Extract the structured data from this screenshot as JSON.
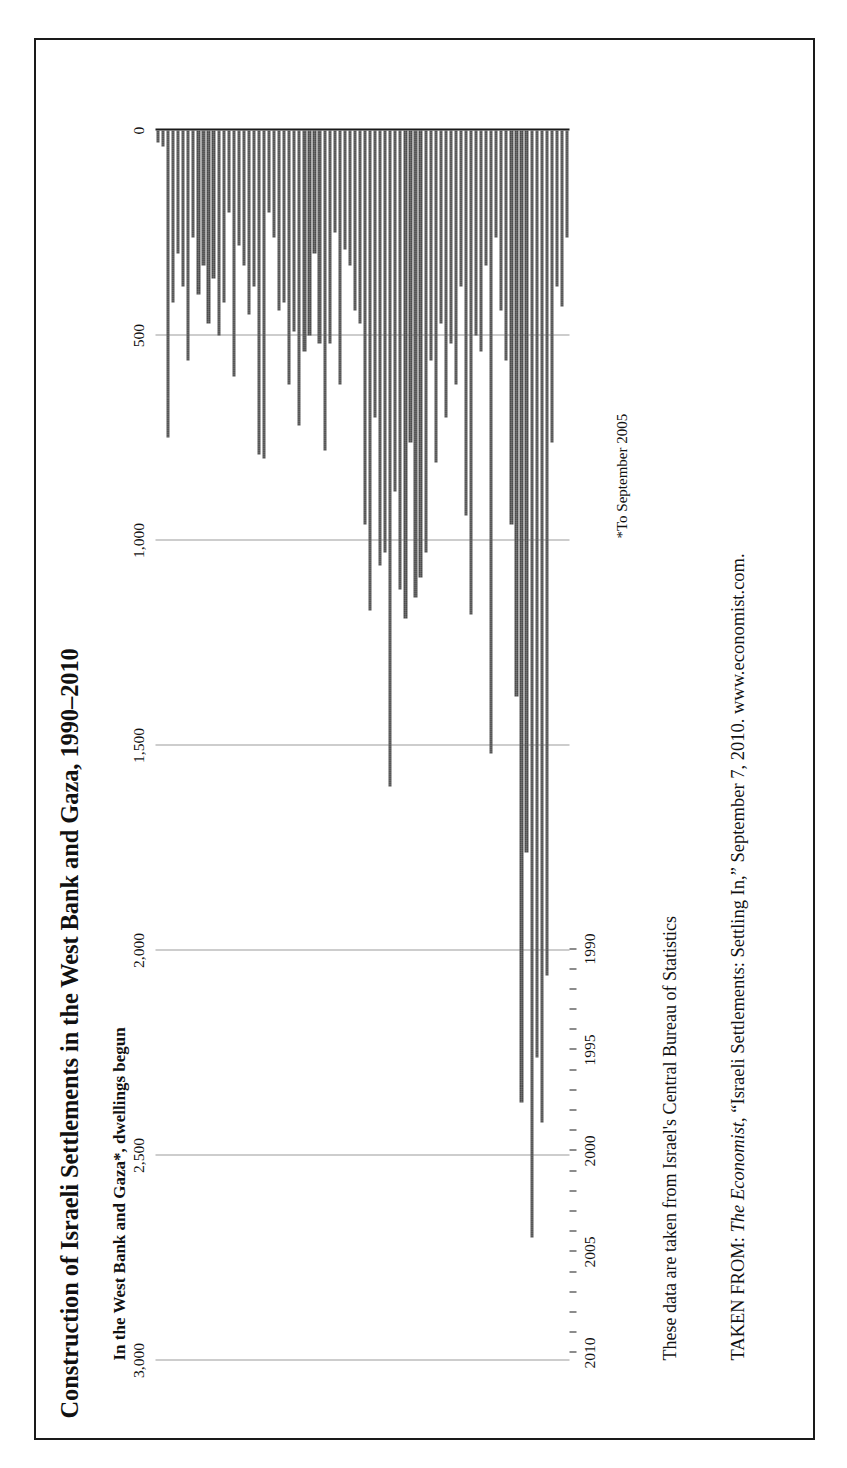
{
  "figure": {
    "title": "Construction of Israeli Settlements in the West Bank and Gaza, 1990–2010",
    "subtitle": "In the West Bank and Gaza*, dwellings begun",
    "footnote": "*To September 2005",
    "source_note": "These data are taken from Israel's Central Bureau of Statistics",
    "citation_prefix": "TAKEN FROM: ",
    "citation_publication": "The Economist",
    "citation_rest": ", “Israeli Settlements: Settling In,” September 7, 2010. www.economist.com.",
    "orientation": "rotated-90-ccw",
    "bar_color": "#4a4a4a",
    "grid_color": "#9b9b9b",
    "axis_color": "#1a1a1a",
    "border_color": "#1a1a1a"
  },
  "chart_data": {
    "type": "bar",
    "title": "Construction of Israeli Settlements in the West Bank and Gaza, 1990–2010",
    "subtitle": "In the West Bank and Gaza*, dwellings begun",
    "xlabel": "",
    "ylabel": "dwellings begun",
    "ylim": [
      0,
      3000
    ],
    "yticks": [
      0,
      500,
      1000,
      1500,
      2000,
      2500,
      3000
    ],
    "ytick_labels": [
      "0",
      "500",
      "1,000",
      "1,500",
      "2,000",
      "2,500",
      "3,000"
    ],
    "xticks": [
      1990,
      1995,
      2000,
      2005,
      2010
    ],
    "xtick_labels": [
      "1990",
      "1995",
      "2000",
      "2005",
      "2010"
    ],
    "grid": true,
    "legend": "none",
    "frequency": "quarterly",
    "x_start": 1990.0,
    "x_step": 0.25,
    "note": "Values are quarterly dwellings begun, read off the 0–3,000 axis.",
    "series": [
      {
        "name": "Dwellings begun",
        "x": [
          1990.0,
          1990.25,
          1990.5,
          1990.75,
          1991.0,
          1991.25,
          1991.5,
          1991.75,
          1992.0,
          1992.25,
          1992.5,
          1992.75,
          1993.0,
          1993.25,
          1993.5,
          1993.75,
          1994.0,
          1994.25,
          1994.5,
          1994.75,
          1995.0,
          1995.25,
          1995.5,
          1995.75,
          1996.0,
          1996.25,
          1996.5,
          1996.75,
          1997.0,
          1997.25,
          1997.5,
          1997.75,
          1998.0,
          1998.25,
          1998.5,
          1998.75,
          1999.0,
          1999.25,
          1999.5,
          1999.75,
          2000.0,
          2000.25,
          2000.5,
          2000.75,
          2001.0,
          2001.25,
          2001.5,
          2001.75,
          2002.0,
          2002.25,
          2002.5,
          2002.75,
          2003.0,
          2003.25,
          2003.5,
          2003.75,
          2004.0,
          2004.25,
          2004.5,
          2004.75,
          2005.0,
          2005.25,
          2005.5,
          2005.75,
          2006.0,
          2006.25,
          2006.5,
          2006.75,
          2007.0,
          2007.25,
          2007.5,
          2007.75,
          2008.0,
          2008.25,
          2008.5,
          2008.75,
          2009.0,
          2009.25,
          2009.5,
          2009.75,
          2010.0,
          2010.25
        ],
        "values": [
          260,
          430,
          380,
          760,
          2060,
          2420,
          2260,
          2700,
          1760,
          2370,
          1380,
          960,
          560,
          440,
          260,
          1520,
          330,
          540,
          500,
          1180,
          940,
          380,
          620,
          520,
          700,
          470,
          810,
          560,
          1030,
          1090,
          1140,
          760,
          1190,
          1120,
          880,
          1600,
          1030,
          1060,
          700,
          1170,
          960,
          470,
          440,
          330,
          290,
          620,
          250,
          520,
          780,
          520,
          300,
          500,
          540,
          720,
          490,
          620,
          420,
          440,
          260,
          200,
          800,
          790,
          380,
          450,
          330,
          280,
          600,
          200,
          420,
          500,
          360,
          470,
          330,
          400,
          260,
          560,
          380,
          300,
          420,
          750,
          40,
          30
        ]
      }
    ]
  }
}
